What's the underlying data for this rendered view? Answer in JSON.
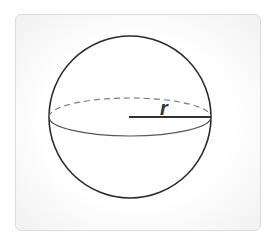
{
  "diagram": {
    "radius_label": "r",
    "colors": {
      "outline": "#2b2b2b",
      "equator_back": "#7a7a7a",
      "equator_front": "#555555",
      "radius_line": "#333333",
      "card_border": "#dcdcdc"
    }
  }
}
